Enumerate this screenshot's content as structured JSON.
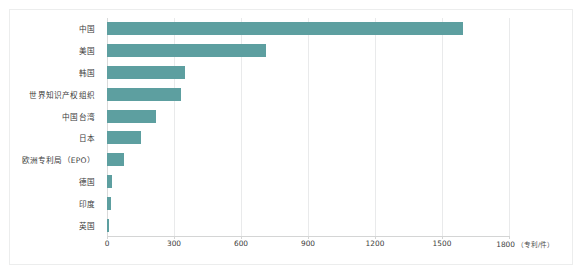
{
  "chart_data": {
    "type": "bar",
    "orientation": "horizontal",
    "title": "",
    "subtitle": "",
    "xlabel": "（专利/件）",
    "ylabel": "",
    "categories": [
      "中国",
      "美国",
      "韩国",
      "世界知识产权组织",
      "中国台湾",
      "日本",
      "欧洲专利局（EPO）",
      "德国",
      "印度",
      "英国"
    ],
    "values": [
      1592,
      711,
      351,
      333,
      220,
      150,
      76,
      22,
      18,
      9
    ],
    "series": [
      {
        "name": "专利数量",
        "values": [
          1592,
          711,
          351,
          333,
          220,
          150,
          76,
          22,
          18,
          9
        ]
      }
    ],
    "xlim": [
      0,
      1800
    ],
    "xticks": [
      0,
      300,
      600,
      900,
      1200,
      1500,
      1800
    ],
    "xtick_labels": [
      "0",
      "300",
      "600",
      "900",
      "1200",
      "1500",
      "1800"
    ],
    "axis_unit_label": "（专利/件）",
    "grid": "vertical",
    "legend": "none",
    "bar_color": "#5d9fa0",
    "gridline_color": "#e9eaeb",
    "background_color": "#ffffff",
    "frame_color": "#eceded"
  }
}
